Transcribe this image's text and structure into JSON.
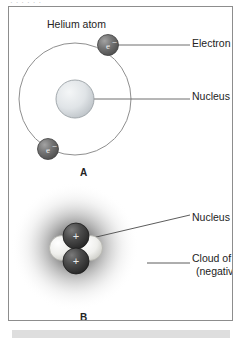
{
  "figure": {
    "top_cutoff_text": "· · · · · ·",
    "panel_label_a": "A",
    "panel_label_b": "B",
    "diagram_a": {
      "title": "Helium atom",
      "electron_symbol": "e",
      "electron_charge": "-",
      "labels": {
        "electron": "Electron",
        "nucleus": "Nucleus"
      },
      "orbit": {
        "cx": 66,
        "cy": 92,
        "r": 56
      },
      "nucleus": {
        "cx": 66,
        "cy": 92,
        "r": 19
      },
      "electrons": [
        {
          "cx": 99,
          "cy": 38,
          "r": 10.5
        },
        {
          "cx": 39,
          "cy": 142,
          "r": 10.5
        }
      ],
      "leader_lines": [
        {
          "x1": 109,
          "y1": 38,
          "x2": 180,
          "y2": 38
        },
        {
          "x1": 66,
          "y1": 92,
          "x2": 180,
          "y2": 92
        }
      ]
    },
    "diagram_b": {
      "labels": {
        "nucleus": "Nucleus",
        "cloud_line1": "Cloud of electrons",
        "cloud_line2": "(negative charges)"
      },
      "proton_symbol": "+",
      "cloud": {
        "cx": 66,
        "cy": 240,
        "r": 62
      },
      "nucleons": [
        {
          "type": "neutron",
          "cx": 52,
          "cy": 240,
          "r": 13
        },
        {
          "type": "neutron",
          "cx": 82,
          "cy": 240,
          "r": 13
        },
        {
          "type": "proton",
          "cx": 67,
          "cy": 228,
          "r": 13
        },
        {
          "type": "proton",
          "cx": 67,
          "cy": 253,
          "r": 13
        }
      ],
      "leader_lines": [
        {
          "x1": 84,
          "y1": 232,
          "x2": 180,
          "y2": 208
        },
        {
          "x1": 120,
          "y1": 256,
          "x2": 180,
          "y2": 256
        }
      ]
    },
    "colors": {
      "frame": "#8d8d8d",
      "text": "#232323",
      "orbit_stroke": "#8f8f8f",
      "leader_stroke": "#6e6e6e",
      "electron_dark": "#5e5e5e",
      "nucleus_light": "#d8dce0",
      "proton_dark": "#3b3b3b",
      "neutron_light": "#e8e8e4",
      "cloud_dark": "#3a3a3a",
      "strip": "#dedede"
    }
  }
}
